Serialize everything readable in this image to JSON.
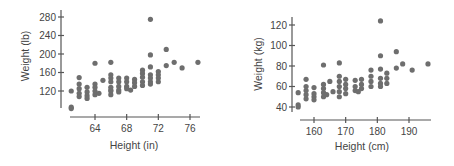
{
  "chart_data": [
    {
      "type": "scatter",
      "title": "",
      "xlabel": "Height (in)",
      "ylabel": "Weight (lb)",
      "xticks": [
        64,
        68,
        72,
        76
      ],
      "yticks": [
        120,
        160,
        200,
        240,
        280
      ],
      "xlim": [
        60,
        78
      ],
      "ylim": [
        80,
        290
      ],
      "grid": false,
      "color": "#6e6e6e",
      "points": [
        [
          61,
          120
        ],
        [
          61,
          85
        ],
        [
          61,
          82
        ],
        [
          62,
          149
        ],
        [
          62,
          135
        ],
        [
          62,
          125
        ],
        [
          62,
          115
        ],
        [
          62,
          108
        ],
        [
          63,
          128
        ],
        [
          63,
          118
        ],
        [
          63,
          110
        ],
        [
          63,
          104
        ],
        [
          64,
          180
        ],
        [
          64,
          135
        ],
        [
          64,
          128
        ],
        [
          64,
          120
        ],
        [
          64,
          112
        ],
        [
          64.5,
          115
        ],
        [
          65,
          143
        ],
        [
          66,
          122
        ],
        [
          66,
          182
        ],
        [
          66,
          155
        ],
        [
          66,
          148
        ],
        [
          66,
          140
        ],
        [
          66,
          128
        ],
        [
          66,
          120
        ],
        [
          66,
          112
        ],
        [
          67,
          148
        ],
        [
          67,
          140
        ],
        [
          67,
          130
        ],
        [
          67,
          122
        ],
        [
          67,
          118
        ],
        [
          68,
          148
        ],
        [
          68,
          140
        ],
        [
          68,
          130
        ],
        [
          68,
          125
        ],
        [
          68.5,
          122
        ],
        [
          69,
          145
        ],
        [
          69,
          138
        ],
        [
          69,
          130
        ],
        [
          70,
          165
        ],
        [
          70,
          158
        ],
        [
          70,
          150
        ],
        [
          70,
          140
        ],
        [
          70,
          132
        ],
        [
          71,
          275
        ],
        [
          71,
          198
        ],
        [
          71,
          172
        ],
        [
          71,
          155
        ],
        [
          71,
          148
        ],
        [
          71,
          140
        ],
        [
          71,
          135
        ],
        [
          72,
          162
        ],
        [
          72,
          155
        ],
        [
          72,
          148
        ],
        [
          72,
          140
        ],
        [
          73,
          210
        ],
        [
          73,
          175
        ],
        [
          74,
          182
        ],
        [
          75,
          170
        ],
        [
          77,
          182
        ]
      ]
    },
    {
      "type": "scatter",
      "title": "",
      "xlabel": "Height (cm)",
      "ylabel": "Weight (kg)",
      "xticks": [
        160,
        170,
        180,
        190
      ],
      "yticks": [
        40,
        60,
        80,
        100,
        120
      ],
      "xlim": [
        153,
        198
      ],
      "ylim": [
        36,
        130
      ],
      "grid": false,
      "color": "#6e6e6e",
      "points": [
        [
          155,
          54
        ],
        [
          155,
          42
        ],
        [
          155,
          40
        ],
        [
          157.5,
          67
        ],
        [
          157.5,
          60
        ],
        [
          157.5,
          56
        ],
        [
          157.5,
          52
        ],
        [
          157.5,
          48
        ],
        [
          160,
          59
        ],
        [
          160,
          53
        ],
        [
          160,
          50
        ],
        [
          160,
          47
        ],
        [
          163,
          81
        ],
        [
          163,
          62
        ],
        [
          163,
          58
        ],
        [
          163,
          54
        ],
        [
          163,
          50
        ],
        [
          164,
          52
        ],
        [
          165,
          65
        ],
        [
          166,
          55
        ],
        [
          168,
          83
        ],
        [
          168,
          70
        ],
        [
          168,
          65
        ],
        [
          168,
          60
        ],
        [
          168,
          55
        ],
        [
          168,
          50
        ],
        [
          170,
          67
        ],
        [
          170,
          62
        ],
        [
          170,
          58
        ],
        [
          170,
          53
        ],
        [
          173,
          66
        ],
        [
          173,
          60
        ],
        [
          173,
          56
        ],
        [
          174,
          55
        ],
        [
          175,
          67
        ],
        [
          175,
          62
        ],
        [
          175,
          58
        ],
        [
          178,
          76
        ],
        [
          178,
          70
        ],
        [
          178,
          65
        ],
        [
          178,
          60
        ],
        [
          181,
          124
        ],
        [
          181,
          90
        ],
        [
          181,
          77
        ],
        [
          181,
          68
        ],
        [
          181,
          63
        ],
        [
          181,
          60
        ],
        [
          183,
          73
        ],
        [
          183,
          68
        ],
        [
          183,
          63
        ],
        [
          186,
          94
        ],
        [
          186,
          78
        ],
        [
          188,
          82
        ],
        [
          191,
          76
        ],
        [
          196,
          82
        ]
      ]
    }
  ]
}
